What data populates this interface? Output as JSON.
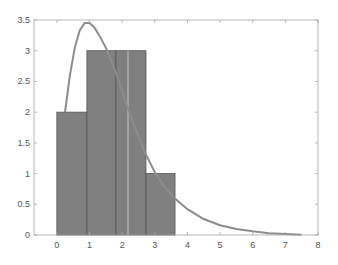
{
  "chart_data": {
    "type": "bar",
    "title": "",
    "xlabel": "",
    "ylabel": "",
    "xlim": [
      -0.7,
      8
    ],
    "ylim": [
      0,
      3.5
    ],
    "grid": false,
    "legend": null,
    "xticks": [
      "0",
      "1",
      "2",
      "3",
      "4",
      "5",
      "6",
      "7",
      "8"
    ],
    "yticks": [
      "0",
      "0.5",
      "1",
      "1.5",
      "2",
      "2.5",
      "3",
      "3.5"
    ],
    "histogram": {
      "bin_edges": [
        0,
        0.92,
        1.81,
        2.73,
        3.62
      ],
      "values": [
        2,
        3,
        3,
        1
      ],
      "fill_color": "#808080",
      "edge_color": "#555555"
    },
    "curve": {
      "type": "line",
      "color": "#8c8c8c",
      "x": [
        0.25,
        0.4,
        0.55,
        0.7,
        0.85,
        1.0,
        1.15,
        1.3,
        1.5,
        1.7,
        1.9,
        2.1,
        2.3,
        2.5,
        2.7,
        3.0,
        3.3,
        3.6,
        4.0,
        4.5,
        5.0,
        5.5,
        6.0,
        6.5,
        7.0,
        7.5
      ],
      "y": [
        2.0,
        2.6,
        3.05,
        3.33,
        3.45,
        3.45,
        3.38,
        3.25,
        3.05,
        2.8,
        2.5,
        2.18,
        1.88,
        1.6,
        1.34,
        1.02,
        0.78,
        0.6,
        0.42,
        0.26,
        0.16,
        0.1,
        0.06,
        0.03,
        0.015,
        0.005
      ]
    }
  }
}
